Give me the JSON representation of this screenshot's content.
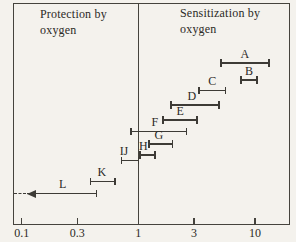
{
  "figure": {
    "bg_color": "#f4f2ed",
    "line_color": "#3d3b36",
    "text_color": "#2c2a26"
  },
  "chart_data": {
    "type": "scatter",
    "subtype": "horizontal-interval-ranges",
    "x_axis": {
      "scale": "log",
      "ticks": [
        0.1,
        0.3,
        1,
        3,
        10
      ],
      "tick_labels": [
        "0.1",
        "0.3",
        "1",
        "3",
        "10"
      ],
      "range": [
        0.08,
        16
      ],
      "grid": false
    },
    "divider_value": 1,
    "annotations": [
      {
        "id": "protection",
        "line1": "Protection by",
        "line2": "oxygen",
        "side": "left"
      },
      {
        "id": "sensitization",
        "line1": "Sensitization by",
        "line2": "oxygen",
        "side": "right"
      }
    ],
    "series": [
      {
        "label": "A",
        "type": "range",
        "lo": 5.1,
        "hi": 13.2,
        "y_px": 63
      },
      {
        "label": "B",
        "type": "range",
        "lo": 7.6,
        "hi": 10.4,
        "y_px": 80
      },
      {
        "label": "C",
        "type": "range",
        "lo": 3.3,
        "hi": 5.6,
        "y_px": 90.5
      },
      {
        "label": "D",
        "type": "range",
        "lo": 1.9,
        "hi": 4.9,
        "y_px": 105,
        "label_dx": -3
      },
      {
        "label": "E",
        "type": "range",
        "lo": 1.63,
        "hi": 3.2,
        "y_px": 120
      },
      {
        "label": "F",
        "type": "range",
        "lo": 0.87,
        "hi": 2.6,
        "y_px": 131.5,
        "label_dx": -4
      },
      {
        "label": "G",
        "type": "range",
        "lo": 1.24,
        "hi": 1.97,
        "y_px": 144,
        "label_dx": -2
      },
      {
        "label": "H",
        "type": "range",
        "lo": 1.03,
        "hi": 1.39,
        "y_px": 155,
        "label_dx": -4
      },
      {
        "label": "IJ",
        "type": "range",
        "lo": 0.72,
        "hi": 1.0,
        "y_px": 160.5,
        "label_dx": -6
      },
      {
        "label": "K",
        "type": "range",
        "lo": 0.39,
        "hi": 0.63,
        "y_px": 181.5,
        "label_dx": -1
      },
      {
        "label": "L",
        "type": "arrow_left",
        "hi": 0.44,
        "tip": 0.11,
        "dashed_to_frame_edge": true,
        "y_px": 193.5,
        "label_dx": 1
      }
    ],
    "pixel_calibration": {
      "x_value_1_px": 138.3,
      "px_per_decade": 116.6,
      "axis_y_px": 224,
      "frame_left_px": 13,
      "frame_top_px": 3,
      "frame_right_px": 290
    }
  }
}
